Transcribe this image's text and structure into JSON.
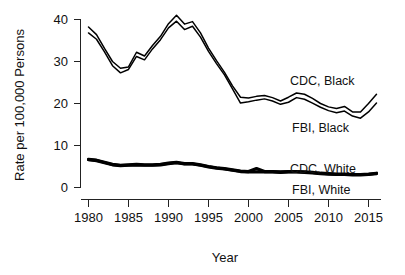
{
  "chart_data": {
    "type": "line",
    "title": "",
    "xlabel": "Year",
    "ylabel": "Rate per 100,000 Persons",
    "xlim": [
      1980,
      2016
    ],
    "ylim": [
      0,
      42
    ],
    "xticks": [
      1980,
      1985,
      1990,
      1995,
      2000,
      2005,
      2010,
      2015
    ],
    "xticklabels": [
      "1980",
      "1985",
      "1990",
      "1995",
      "2000",
      "2005",
      "2010",
      "2015"
    ],
    "yticks": [
      0,
      10,
      20,
      30,
      40
    ],
    "yticklabels": [
      "0",
      "10",
      "20",
      "30",
      "40"
    ],
    "grid": false,
    "legend_position": "inline-right",
    "x": [
      1980,
      1981,
      1982,
      1983,
      1984,
      1985,
      1986,
      1987,
      1988,
      1989,
      1990,
      1991,
      1992,
      1993,
      1994,
      1995,
      1996,
      1997,
      1998,
      1999,
      2000,
      2001,
      2002,
      2003,
      2004,
      2005,
      2006,
      2007,
      2008,
      2009,
      2010,
      2011,
      2012,
      2013,
      2014,
      2015,
      2016
    ],
    "series": [
      {
        "name": "CDC, Black",
        "label": "CDC, Black",
        "color": "#000000",
        "style": "thin",
        "values": [
          38.2,
          36.4,
          33.1,
          30.0,
          28.4,
          28.7,
          32.2,
          31.3,
          33.8,
          36.0,
          39.0,
          41.0,
          38.9,
          39.5,
          36.8,
          33.2,
          30.2,
          27.4,
          24.2,
          21.5,
          21.3,
          21.7,
          21.9,
          21.4,
          20.6,
          21.5,
          22.5,
          22.2,
          21.2,
          20.0,
          19.2,
          18.8,
          19.3,
          18.0,
          18.0,
          20.0,
          22.2
        ]
      },
      {
        "name": "FBI, Black",
        "label": "FBI, Black",
        "color": "#000000",
        "style": "thin",
        "values": [
          36.8,
          35.3,
          32.3,
          29.0,
          27.3,
          28.1,
          31.2,
          30.4,
          33.0,
          35.2,
          38.0,
          39.6,
          37.6,
          38.4,
          35.8,
          32.4,
          29.5,
          26.8,
          23.5,
          20.1,
          20.4,
          20.8,
          21.1,
          20.6,
          19.8,
          20.3,
          21.4,
          21.0,
          20.1,
          19.1,
          18.3,
          17.8,
          18.2,
          17.0,
          16.5,
          18.0,
          20.1
        ]
      },
      {
        "name": "CDC, White",
        "label": "CDC, White",
        "color": "#000000",
        "style": "thick",
        "values": [
          6.7,
          6.5,
          6.0,
          5.5,
          5.3,
          5.4,
          5.5,
          5.4,
          5.4,
          5.5,
          5.8,
          6.0,
          5.7,
          5.7,
          5.4,
          5.0,
          4.7,
          4.5,
          4.2,
          3.9,
          3.8,
          4.5,
          3.8,
          3.8,
          3.7,
          3.8,
          3.8,
          3.7,
          3.6,
          3.4,
          3.3,
          3.2,
          3.2,
          3.1,
          3.1,
          3.2,
          3.4
        ]
      },
      {
        "name": "FBI, White",
        "label": "FBI, White",
        "color": "#000000",
        "style": "thick",
        "values": [
          6.6,
          6.4,
          5.9,
          5.4,
          5.2,
          5.3,
          5.4,
          5.3,
          5.3,
          5.4,
          5.7,
          5.9,
          5.6,
          5.6,
          5.3,
          4.9,
          4.6,
          4.4,
          4.1,
          3.8,
          3.7,
          3.7,
          3.7,
          3.7,
          3.6,
          3.7,
          3.7,
          3.6,
          3.5,
          3.3,
          3.2,
          3.1,
          3.1,
          3.0,
          3.0,
          3.1,
          3.3
        ]
      }
    ],
    "annotations": [
      {
        "id": "cdc-black",
        "text": "CDC, Black",
        "x_px": 290,
        "y_px": 85
      },
      {
        "id": "fbi-black",
        "text": "FBI, Black",
        "x_px": 292,
        "y_px": 132
      },
      {
        "id": "cdc-white",
        "text": "CDC, White",
        "x_px": 290,
        "y_px": 173
      },
      {
        "id": "fbi-white",
        "text": "FBI, White",
        "x_px": 292,
        "y_px": 194
      }
    ]
  }
}
